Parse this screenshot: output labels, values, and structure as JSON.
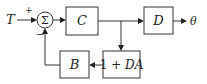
{
  "diagram": {
    "type": "block-diagram",
    "input": {
      "label": "T"
    },
    "output": {
      "label": "θ"
    },
    "summing_junction": {
      "symbol": "Σ",
      "plus_sign": "+",
      "minus_sign": "−"
    },
    "blocks": [
      {
        "id": "C",
        "label": "C"
      },
      {
        "id": "D",
        "label": "D"
      },
      {
        "id": "oneplusDA",
        "label": "1 + DA"
      },
      {
        "id": "B",
        "label": "B"
      }
    ],
    "connections": [
      {
        "from": "T",
        "to": "summing_junction",
        "sign": "+"
      },
      {
        "from": "summing_junction",
        "to": "C"
      },
      {
        "from": "C",
        "to": "D"
      },
      {
        "from": "D",
        "to": "θ"
      },
      {
        "from": "C-output-branch",
        "to": "1 + DA"
      },
      {
        "from": "1 + DA",
        "to": "B"
      },
      {
        "from": "B",
        "to": "summing_junction",
        "sign": "−"
      }
    ],
    "colors": {
      "line": "#333333",
      "background": "#ffffff"
    }
  }
}
